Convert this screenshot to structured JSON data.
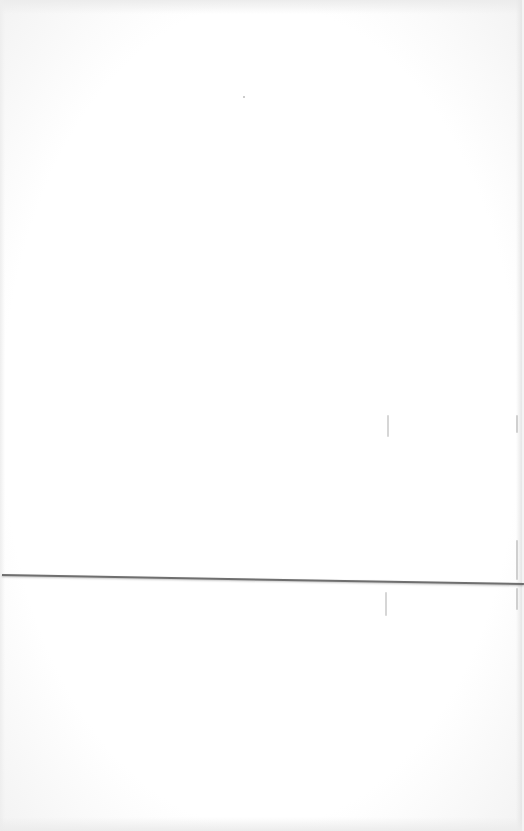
{
  "page": {
    "text_content": []
  },
  "colors": {
    "paper": "#ffffff",
    "edge_shadow": "#ececec",
    "fold_line": "#6f6f6f",
    "faint_marks": "#d6d6d6"
  }
}
